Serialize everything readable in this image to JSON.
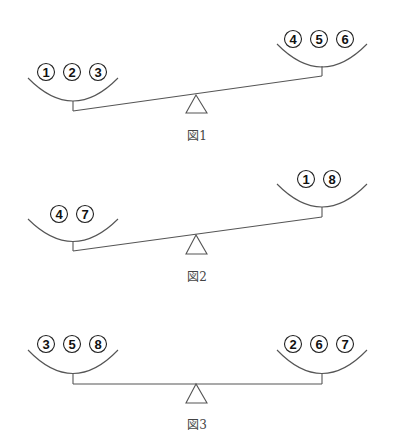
{
  "figures": [
    {
      "caption": "図1",
      "left_pan": {
        "balls": [
          "1",
          "2",
          "3"
        ]
      },
      "right_pan": {
        "balls": [
          "4",
          "5",
          "6"
        ]
      },
      "tilt": "left side down"
    },
    {
      "caption": "図2",
      "left_pan": {
        "balls": [
          "4",
          "7"
        ]
      },
      "right_pan": {
        "balls": [
          "1",
          "8"
        ]
      },
      "tilt": "left side down"
    },
    {
      "caption": "図3",
      "left_pan": {
        "balls": [
          "3",
          "5",
          "8"
        ]
      },
      "right_pan": {
        "balls": [
          "2",
          "6",
          "7"
        ]
      },
      "tilt": "balanced"
    }
  ],
  "colors": {
    "line": "#555555",
    "ball_stroke": "#222222",
    "text": "#111111"
  }
}
